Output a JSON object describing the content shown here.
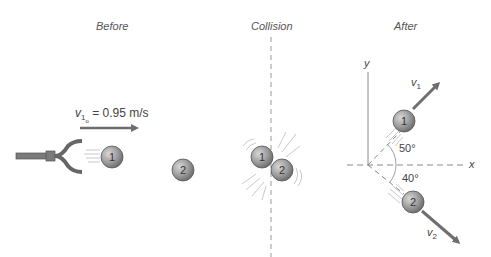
{
  "panels": {
    "before": {
      "title": "Before",
      "velocity_label": "v",
      "velocity_sub": "1",
      "velocity_subsub": "o",
      "velocity_value": "= 0.95 m/s"
    },
    "collision": {
      "title": "Collision"
    },
    "after": {
      "title": "After",
      "axis_y": "y",
      "axis_x": "x",
      "v1_label": "v",
      "v1_sub": "1",
      "v2_label": "v",
      "v2_sub": "2",
      "angle1": "50°",
      "angle2": "40°"
    }
  },
  "balls": {
    "one": "1",
    "two": "2"
  },
  "colors": {
    "ball": "#8a8a8a",
    "arrow": "#6e6e6e",
    "text": "#444444"
  }
}
